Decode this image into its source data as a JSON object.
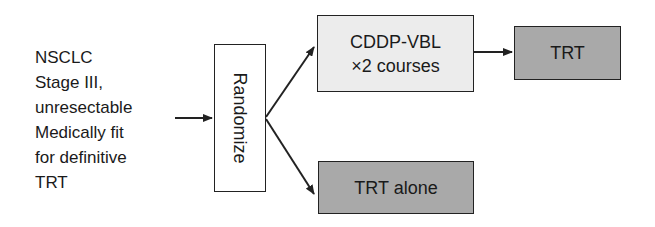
{
  "diagram": {
    "type": "trial-flowchart",
    "criteria": {
      "lines": [
        "NSCLC",
        "Stage III,",
        "unresectable",
        "Medically fit",
        "for definitive",
        "TRT"
      ]
    },
    "randomize": {
      "label": "Randomize"
    },
    "arm_chemo": {
      "line1": "CDDP-VBL",
      "line2": "×2 courses"
    },
    "arm_chemo_followup": {
      "label": "TRT"
    },
    "arm_control": {
      "label": "TRT alone"
    },
    "colors": {
      "light_box": "#ececec",
      "dark_box": "#a9a9a9",
      "stroke": "#222222"
    }
  }
}
